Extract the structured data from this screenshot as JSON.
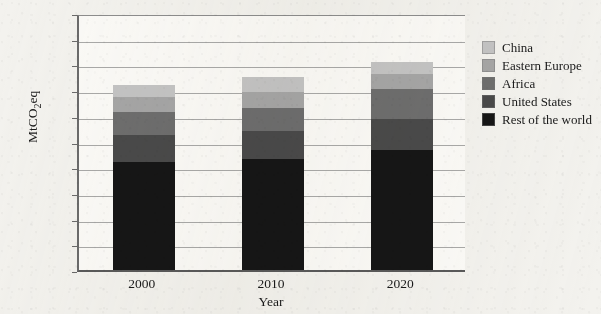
{
  "chart_data": {
    "type": "bar",
    "subtype": "stacked-bar",
    "title": "",
    "xlabel": "Year",
    "ylabel": "MtCO2eq",
    "ylabel_parts": {
      "pre": "MtCO",
      "sub": "2",
      "post": "eq"
    },
    "categories": [
      "2000",
      "2010",
      "2020"
    ],
    "ylim": [
      0,
      1000
    ],
    "ytick_values": [
      0,
      100,
      200,
      300,
      400,
      500,
      600,
      700,
      800,
      900,
      1000
    ],
    "ytick_labels": [
      "0",
      "100",
      "200",
      "300",
      "400",
      "500",
      "600",
      "700",
      "800",
      "900",
      "1,000"
    ],
    "grid": true,
    "legend_position": "right",
    "series": [
      {
        "name": "Rest of the world",
        "color": "#161616",
        "values": [
          420,
          432,
          466
        ]
      },
      {
        "name": "United States",
        "color": "#4a4a4a",
        "values": [
          105,
          108,
          120
        ]
      },
      {
        "name": "Africa",
        "color": "#6e6e6e",
        "values": [
          90,
          92,
          120
        ]
      },
      {
        "name": "Eastern Europe",
        "color": "#a6a6a6",
        "values": [
          58,
          60,
          58
        ]
      },
      {
        "name": "China",
        "color": "#c4c4c4",
        "values": [
          47,
          58,
          46
        ]
      }
    ],
    "totals": [
      720,
      750,
      810
    ],
    "stack_order_bottom_to_top": [
      "Rest of the world",
      "United States",
      "Africa",
      "Eastern Europe",
      "China"
    ]
  },
  "legend": {
    "items": [
      {
        "label": "China",
        "color": "#c4c4c4"
      },
      {
        "label": "Eastern Europe",
        "color": "#a6a6a6"
      },
      {
        "label": "Africa",
        "color": "#6e6e6e"
      },
      {
        "label": "United States",
        "color": "#4a4a4a"
      },
      {
        "label": "Rest of the world",
        "color": "#161616"
      }
    ]
  }
}
